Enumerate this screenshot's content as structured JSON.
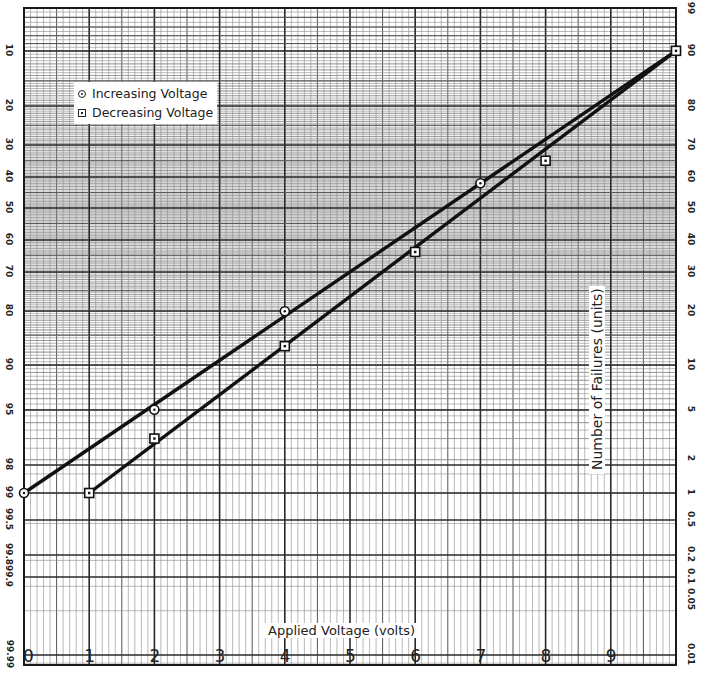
{
  "chart_data": {
    "type": "line",
    "title": "",
    "xlabel": "Applied Voltage (volts)",
    "ylabel": "Number of Failures (units)",
    "grid": true,
    "x_scale": "linear",
    "y_scale": "normal-probability",
    "xlim": [
      0,
      10
    ],
    "x_ticks": [
      "0",
      "1",
      "2",
      "3",
      "4",
      "5",
      "6",
      "7",
      "8",
      "9"
    ],
    "left_axis_ticks": [
      "10",
      "20",
      "30",
      "40",
      "50",
      "60",
      "70",
      "80",
      "90",
      "95",
      "98",
      "99",
      "99.5",
      "99.8",
      "99.9",
      "99.99"
    ],
    "right_axis_ticks": [
      "99",
      "90",
      "80",
      "70",
      "60",
      "50",
      "40",
      "30",
      "20",
      "10",
      "5",
      "2",
      "1",
      "0.5",
      "0.2",
      "0.1",
      "0.05",
      "0.01"
    ],
    "legend": {
      "position": "upper-left",
      "entries": [
        {
          "label": "Increasing Voltage",
          "marker": "circle"
        },
        {
          "label": "Decreasing Voltage",
          "marker": "square"
        }
      ]
    },
    "series": [
      {
        "name": "Increasing Voltage",
        "marker": "circle",
        "x": [
          0,
          2,
          4,
          7,
          10
        ],
        "y_left_percent": [
          99,
          95,
          80,
          42,
          10
        ]
      },
      {
        "name": "Decreasing Voltage",
        "marker": "square",
        "x": [
          1,
          2,
          4,
          6,
          8,
          10
        ],
        "y_left_percent": [
          99,
          97,
          87,
          64,
          35,
          10
        ]
      }
    ]
  },
  "legend": {
    "increasing_label": "Increasing Voltage",
    "decreasing_label": "Decreasing Voltage"
  },
  "axes": {
    "xlabel": "Applied Voltage (volts)",
    "ylabel": "Number of Failures (units)",
    "x_ticks": [
      "0",
      "1",
      "2",
      "3",
      "4",
      "5",
      "6",
      "7",
      "8",
      "9"
    ],
    "left_ticks": [
      {
        "label": "10",
        "y": 51
      },
      {
        "label": "20",
        "y": 106
      },
      {
        "label": "30",
        "y": 145
      },
      {
        "label": "40",
        "y": 177
      },
      {
        "label": "50",
        "y": 208
      },
      {
        "label": "60",
        "y": 240
      },
      {
        "label": "70",
        "y": 272
      },
      {
        "label": "80",
        "y": 311
      },
      {
        "label": "90",
        "y": 365
      },
      {
        "label": "95",
        "y": 410
      },
      {
        "label": "98",
        "y": 465
      },
      {
        "label": "99",
        "y": 493
      },
      {
        "label": "99.5",
        "y": 520
      },
      {
        "label": "99.8",
        "y": 555
      },
      {
        "label": "99.9",
        "y": 577
      },
      {
        "label": "99.99",
        "y": 655
      }
    ],
    "right_ticks": [
      {
        "label": "99",
        "y": 9
      },
      {
        "label": "90",
        "y": 51
      },
      {
        "label": "80",
        "y": 106
      },
      {
        "label": "70",
        "y": 145
      },
      {
        "label": "60",
        "y": 177
      },
      {
        "label": "50",
        "y": 208
      },
      {
        "label": "40",
        "y": 240
      },
      {
        "label": "30",
        "y": 272
      },
      {
        "label": "20",
        "y": 311
      },
      {
        "label": "10",
        "y": 365
      },
      {
        "label": "5",
        "y": 410
      },
      {
        "label": "2",
        "y": 459
      },
      {
        "label": "1",
        "y": 493
      },
      {
        "label": "0.5",
        "y": 520
      },
      {
        "label": "0.2",
        "y": 555
      },
      {
        "label": "0.1",
        "y": 577
      },
      {
        "label": "0.05",
        "y": 600
      },
      {
        "label": "0.01",
        "y": 655
      }
    ]
  },
  "colors": {
    "ink": "#1a1a1a",
    "grid_major": "#2a2a2a",
    "grid_minor": "#7a7a7a",
    "background": "#ffffff"
  }
}
